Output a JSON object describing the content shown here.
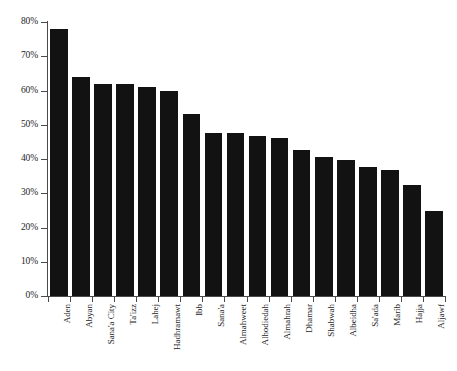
{
  "chart_data": {
    "type": "bar",
    "title": "",
    "subtitle": "",
    "xlabel": "",
    "ylabel": "",
    "ylim": [
      0,
      80
    ],
    "ytick_labels": [
      "0%",
      "10%",
      "20%",
      "30%",
      "40%",
      "50%",
      "60%",
      "70%",
      "80%"
    ],
    "ytick_values": [
      0,
      10,
      20,
      30,
      40,
      50,
      60,
      70,
      80
    ],
    "grid": false,
    "legend": null,
    "bar_color": "#121212",
    "axis_color": "#4a4a4a",
    "categories": [
      "Aden",
      "Abyan",
      "Sana'a City",
      "Ta'izz",
      "Lahej",
      "Hadhramawt",
      "Ibb",
      "Sana'a",
      "Almahweet",
      "Alhodiedah",
      "Almahrah",
      "Dhamar",
      "Shabwah",
      "Albeidha",
      "Sa'ada",
      "Marib",
      "Hajja",
      "Aljawf"
    ],
    "values": [
      78.0,
      64.0,
      62.0,
      62.0,
      61.0,
      59.8,
      53.0,
      47.7,
      47.7,
      46.8,
      46.0,
      42.6,
      40.7,
      39.6,
      37.6,
      36.8,
      32.4,
      24.7
    ]
  },
  "footnote": {
    "text": ""
  }
}
